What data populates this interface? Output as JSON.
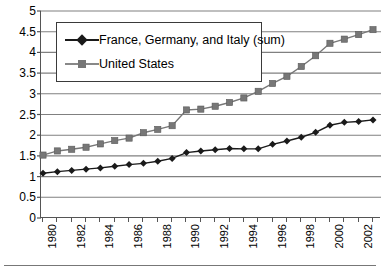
{
  "chart_data": {
    "type": "line",
    "title": "",
    "subtitle": "",
    "xlabel": "",
    "ylabel": "",
    "x": [
      1980,
      1981,
      1982,
      1983,
      1984,
      1985,
      1986,
      1987,
      1988,
      1989,
      1990,
      1991,
      1992,
      1993,
      1994,
      1995,
      1996,
      1997,
      1998,
      1999,
      2000,
      2001,
      2002,
      2003
    ],
    "categories": [
      "1980",
      "1981",
      "1982",
      "1983",
      "1984",
      "1985",
      "1986",
      "1987",
      "1988",
      "1989",
      "1990",
      "1991",
      "1992",
      "1993",
      "1994",
      "1995",
      "1996",
      "1997",
      "1998",
      "1999",
      "2000",
      "2001",
      "2002",
      "2003"
    ],
    "series": [
      {
        "name": "France, Germany, and Italy (sum)",
        "color": "#1a1a1a",
        "marker": "diamond",
        "values": [
          1.08,
          1.12,
          1.15,
          1.18,
          1.21,
          1.25,
          1.29,
          1.32,
          1.37,
          1.44,
          1.58,
          1.62,
          1.65,
          1.68,
          1.67,
          1.67,
          1.78,
          1.86,
          1.95,
          2.07,
          2.24,
          2.31,
          2.33,
          2.37
        ]
      },
      {
        "name": "United States",
        "color": "#777777",
        "marker": "square",
        "values": [
          1.52,
          1.62,
          1.66,
          1.71,
          1.79,
          1.87,
          1.93,
          2.06,
          2.14,
          2.23,
          2.61,
          2.63,
          2.7,
          2.79,
          2.9,
          3.06,
          3.25,
          3.42,
          3.66,
          3.92,
          4.22,
          4.32,
          4.43,
          4.55
        ]
      }
    ],
    "ylim": [
      0,
      5
    ],
    "yticks": [
      0,
      0.5,
      1,
      1.5,
      2,
      2.5,
      3,
      3.5,
      4,
      4.5,
      5
    ],
    "ytick_labels": [
      "0",
      "0.5",
      "1",
      "1.5",
      "2",
      "2.5",
      "3",
      "3.5",
      "4",
      "4.5",
      "5"
    ],
    "xtick_labels": [
      "1980",
      "1982",
      "1984",
      "1986",
      "1988",
      "1990",
      "1992",
      "1994",
      "1996",
      "1998",
      "2000",
      "2002"
    ],
    "xtick_values": [
      1980,
      1982,
      1984,
      1986,
      1988,
      1990,
      1992,
      1994,
      1996,
      1998,
      2000,
      2002
    ],
    "grid": "horizontal",
    "legend_position": "upper-left-inside",
    "gridline_color": "#808080",
    "axis_color": "#555555",
    "background": "#ffffff"
  },
  "legend": {
    "items": [
      {
        "label": "France, Germany, and Italy (sum)",
        "color": "#1a1a1a",
        "marker": "diamond"
      },
      {
        "label": "United States",
        "color": "#777777",
        "marker": "square"
      }
    ]
  }
}
